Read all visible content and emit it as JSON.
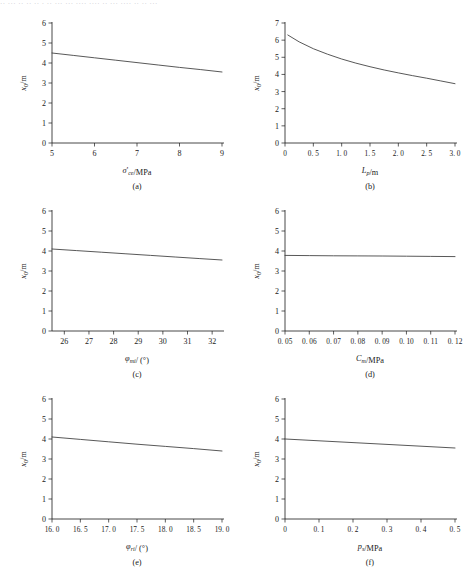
{
  "figure": {
    "top_strip_text": "·· ··· ·· ·· ·· · ·· ··· ··· ···· ···· ·· ··· ···· ·· ·· ···",
    "panel_count": 6
  },
  "chart_data": [
    {
      "type": "line",
      "panel": "a",
      "caption": "(a)",
      "title": "",
      "xlabel_html": "<i>&sigma;</i>'<sub>ce</sub>/MPa",
      "xlabel": "σ'ce/MPa",
      "ylabel_html": "<i>x</i><sub>0</sub>/m",
      "ylabel": "x0/m",
      "xlim": [
        5,
        9
      ],
      "ylim": [
        0,
        6
      ],
      "xticks": [
        5,
        6,
        7,
        8,
        9
      ],
      "xticklabels": [
        "5",
        "6",
        "7",
        "8",
        "9"
      ],
      "yticks": [
        0,
        1,
        2,
        3,
        4,
        5,
        6
      ],
      "yticklabels": [
        "0",
        "1",
        "2",
        "3",
        "4",
        "5",
        "6"
      ],
      "grid": false,
      "legend": "none",
      "x": [
        5.0,
        5.5,
        6.0,
        6.5,
        7.0,
        7.5,
        8.0,
        8.5,
        9.0
      ],
      "values": [
        4.5,
        4.38,
        4.26,
        4.14,
        4.02,
        3.9,
        3.78,
        3.67,
        3.55
      ]
    },
    {
      "type": "line",
      "panel": "b",
      "caption": "(b)",
      "title": "",
      "xlabel_html": "<i>L</i><sub>p</sub>/m",
      "xlabel": "Lp/m",
      "ylabel_html": "<i>x</i><sub>0</sub>/m",
      "ylabel": "x0/m",
      "xlim": [
        0,
        3.0
      ],
      "ylim": [
        0,
        7
      ],
      "xticks": [
        0,
        0.5,
        1.0,
        1.5,
        2.0,
        2.5,
        3.0
      ],
      "xticklabels": [
        "0",
        "0. 5",
        "1. 0",
        "1. 5",
        "2. 0",
        "2. 5",
        "3. 0"
      ],
      "yticks": [
        0,
        1,
        2,
        3,
        4,
        5,
        6,
        7
      ],
      "yticklabels": [
        "0",
        "1",
        "2",
        "3",
        "4",
        "5",
        "6",
        "7"
      ],
      "grid": false,
      "legend": "none",
      "x": [
        0.05,
        0.25,
        0.5,
        0.75,
        1.0,
        1.25,
        1.5,
        1.75,
        2.0,
        2.25,
        2.5,
        2.75,
        3.0
      ],
      "values": [
        6.3,
        5.9,
        5.5,
        5.18,
        4.9,
        4.66,
        4.45,
        4.26,
        4.09,
        3.93,
        3.78,
        3.62,
        3.46
      ]
    },
    {
      "type": "line",
      "panel": "c",
      "caption": "(c)",
      "title": "",
      "xlabel_html": "<i>&phi;</i><sub>mi</sub>/ (°)",
      "xlabel": "φmi/ (°)",
      "ylabel_html": "<i>x</i><sub>0</sub>/m",
      "ylabel": "x0/m",
      "xlim": [
        25.5,
        32.4
      ],
      "ylim": [
        0,
        6
      ],
      "xticks": [
        26,
        27,
        28,
        29,
        30,
        31,
        32
      ],
      "xticklabels": [
        "26",
        "27",
        "28",
        "29",
        "30",
        "31",
        "32"
      ],
      "yticks": [
        0,
        1,
        2,
        3,
        4,
        5,
        6
      ],
      "yticklabels": [
        "0",
        "1",
        "2",
        "3",
        "4",
        "5",
        "6"
      ],
      "grid": false,
      "legend": "none",
      "x": [
        25.5,
        26.5,
        27.5,
        28.5,
        29.5,
        30.5,
        31.5,
        32.4
      ],
      "values": [
        4.1,
        4.02,
        3.94,
        3.86,
        3.78,
        3.7,
        3.62,
        3.55
      ]
    },
    {
      "type": "line",
      "panel": "d",
      "caption": "(d)",
      "title": "",
      "xlabel_html": "<i>C</i><sub>m</sub>/MPa",
      "xlabel": "Cm/MPa",
      "ylabel_html": "<i>x</i><sub>0</sub>/m",
      "ylabel": "x0/m",
      "xlim": [
        0.05,
        0.12
      ],
      "ylim": [
        0,
        6
      ],
      "xticks": [
        0.05,
        0.06,
        0.07,
        0.08,
        0.09,
        0.1,
        0.11,
        0.12
      ],
      "xticklabels": [
        "0. 05",
        "0. 06",
        "0. 07",
        "0. 08",
        "0. 09",
        "0. 10",
        "0. 11",
        "0. 12"
      ],
      "yticks": [
        0,
        1,
        2,
        3,
        4,
        5,
        6
      ],
      "yticklabels": [
        "0",
        "1",
        "2",
        "3",
        "4",
        "5",
        "6"
      ],
      "grid": false,
      "legend": "none",
      "x": [
        0.05,
        0.06,
        0.07,
        0.08,
        0.09,
        0.1,
        0.11,
        0.12
      ],
      "values": [
        3.78,
        3.77,
        3.76,
        3.755,
        3.75,
        3.74,
        3.73,
        3.72
      ]
    },
    {
      "type": "line",
      "panel": "e",
      "caption": "(e)",
      "title": "",
      "xlabel_html": "<i>&phi;</i><sub>ri</sub>/ (°)",
      "xlabel": "φri/ (°)",
      "ylabel_html": "<i>x</i><sub>0</sub>/m",
      "ylabel": "x0/m",
      "xlim": [
        16.0,
        19.0
      ],
      "ylim": [
        0,
        6
      ],
      "xticks": [
        16.0,
        16.5,
        17.0,
        17.5,
        18.0,
        18.5,
        19.0
      ],
      "xticklabels": [
        "16. 0",
        "16. 5",
        "17. 0",
        "17. 5",
        "18. 0",
        "18. 5",
        "19. 0"
      ],
      "yticks": [
        0,
        1,
        2,
        3,
        4,
        5,
        6
      ],
      "yticklabels": [
        "0",
        "1",
        "2",
        "3",
        "4",
        "5",
        "6"
      ],
      "grid": false,
      "legend": "none",
      "x": [
        16.0,
        16.5,
        17.0,
        17.5,
        18.0,
        18.5,
        19.0
      ],
      "values": [
        4.1,
        3.98,
        3.86,
        3.74,
        3.63,
        3.52,
        3.4
      ]
    },
    {
      "type": "line",
      "panel": "f",
      "caption": "(f)",
      "title": "",
      "xlabel_html": "<i>p</i><sub>s</sub>/MPa",
      "xlabel": "ps/MPa",
      "ylabel_html": "<i>x</i><sub>0</sub>/m",
      "ylabel": "x0/m",
      "xlim": [
        0,
        0.5
      ],
      "ylim": [
        0,
        6
      ],
      "xticks": [
        0,
        0.1,
        0.2,
        0.3,
        0.4,
        0.5
      ],
      "xticklabels": [
        "0",
        "0. 1",
        "0. 2",
        "0. 3",
        "0. 4",
        "0. 5"
      ],
      "yticks": [
        0,
        1,
        2,
        3,
        4,
        5,
        6
      ],
      "yticklabels": [
        "0",
        "1",
        "2",
        "3",
        "4",
        "5",
        "6"
      ],
      "grid": false,
      "legend": "none",
      "x": [
        0.0,
        0.1,
        0.2,
        0.3,
        0.4,
        0.5
      ],
      "values": [
        4.0,
        3.91,
        3.82,
        3.73,
        3.64,
        3.55
      ]
    }
  ]
}
